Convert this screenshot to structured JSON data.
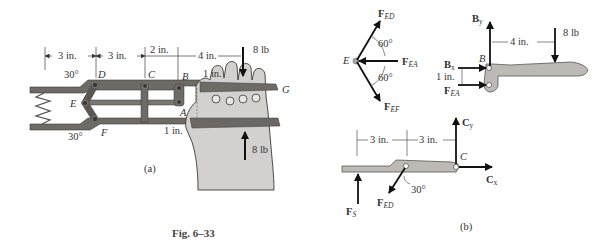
{
  "figure": {
    "caption": "Fig. 6–33",
    "colors": {
      "background": "#ffffff",
      "member": "#6e6a66",
      "member_dark": "#4a4643",
      "member_light": "#bdbab6",
      "hand": "#d2d1cf",
      "hand_outline": "#3a3a3a",
      "arrow": "#111111",
      "text": "#333333"
    }
  },
  "part_a": {
    "label": "(a)",
    "dimensions": [
      "3 in.",
      "3 in.",
      "2 in.",
      "4 in."
    ],
    "load_top": "8 lb",
    "load_bottom": "8 lb",
    "offset_top": "1 in.",
    "offset_bottom": "1 in.",
    "angle_top": "30°",
    "angle_bottom": "30°",
    "points": {
      "D": "D",
      "C": "C",
      "B": "B",
      "E": "E",
      "F": "F",
      "A": "A",
      "G": "G"
    }
  },
  "part_b": {
    "label": "(b)",
    "joint_E": {
      "point": "E",
      "force_ed": {
        "main": "F",
        "sub": "ED"
      },
      "force_ea": {
        "main": "F",
        "sub": "EA"
      },
      "force_ef": {
        "main": "F",
        "sub": "EF"
      },
      "angle_upper": "60°",
      "angle_lower": "60°"
    },
    "handle_fbd": {
      "point": "B",
      "by": {
        "main": "B",
        "sub": "y"
      },
      "bx": {
        "main": "B",
        "sub": "x"
      },
      "fea": {
        "main": "F",
        "sub": "EA"
      },
      "dim_horizontal": "4 in.",
      "dim_vertical": "1 in.",
      "load": "8 lb"
    },
    "jaw_fbd": {
      "point": "C",
      "cy": {
        "main": "C",
        "sub": "y"
      },
      "cx": {
        "main": "C",
        "sub": "x"
      },
      "fs": {
        "main": "F",
        "sub": "S"
      },
      "fed": {
        "main": "F",
        "sub": "ED"
      },
      "dim1": "3 in.",
      "dim2": "3 in.",
      "angle": "30°"
    }
  }
}
